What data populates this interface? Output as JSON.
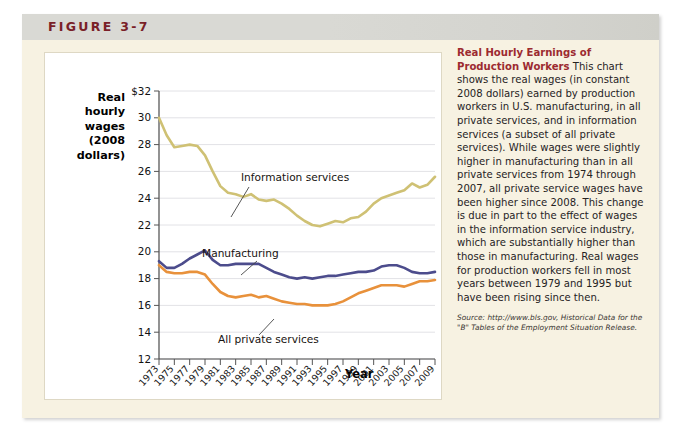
{
  "figure": {
    "label": "FIGURE 3-7"
  },
  "caption": {
    "title": "Real Hourly Earnings of Production Workers",
    "body": " This chart shows the real wages (in constant 2008 dollars) earned by production workers in U.S. manufacturing, in all private services, and in information services (a subset of all private services). While wages were slightly higher in manufacturing than in all private services from 1974 through 2007, all private service wages have been higher since 2008. This change is due in part to the effect of wages in the information service industry, which are substantially higher than those in manufacturing. Real wages for production workers fell in most years between 1979 and 1995 but have been rising since then.",
    "source": "Source: http://www.bls.gov, Historical Data for the \"B\" Tables of the Employment Situation Release."
  },
  "chart_data": {
    "type": "line",
    "title": "Real Hourly Earnings of Production Workers",
    "ylabel": "Real hourly wages (2008 dollars)",
    "ylabel_lines": [
      "Real",
      "hourly",
      "wages",
      "(2008",
      "dollars)"
    ],
    "xlabel": "Year",
    "ylim": [
      12,
      32
    ],
    "ytick_labels": [
      "$32",
      "30",
      "28",
      "26",
      "24",
      "22",
      "20",
      "18",
      "16",
      "14",
      "12"
    ],
    "ytick_values": [
      32,
      30,
      28,
      26,
      24,
      22,
      20,
      18,
      16,
      14,
      12
    ],
    "grid": true,
    "legend_position": "inline-annotations",
    "x": [
      1973,
      1974,
      1975,
      1976,
      1977,
      1978,
      1979,
      1980,
      1981,
      1982,
      1983,
      1984,
      1985,
      1986,
      1987,
      1988,
      1989,
      1990,
      1991,
      1992,
      1993,
      1994,
      1995,
      1996,
      1997,
      1998,
      1999,
      2000,
      2001,
      2002,
      2003,
      2004,
      2005,
      2006,
      2007,
      2008,
      2009
    ],
    "xtick_labels": [
      "1973",
      "1975",
      "1977",
      "1979",
      "1981",
      "1983",
      "1985",
      "1987",
      "1989",
      "1991",
      "1993",
      "1995",
      "1997",
      "1999",
      "2001",
      "2003",
      "2005",
      "2007",
      "2009"
    ],
    "series": [
      {
        "name": "Information services",
        "color": "#cfc174",
        "values": [
          30.0,
          28.7,
          27.8,
          27.9,
          28.0,
          27.9,
          27.2,
          26.0,
          24.9,
          24.4,
          24.3,
          24.1,
          24.3,
          23.9,
          23.8,
          23.9,
          23.6,
          23.2,
          22.7,
          22.3,
          22.0,
          21.9,
          22.1,
          22.3,
          22.2,
          22.5,
          22.6,
          23.0,
          23.6,
          24.0,
          24.2,
          24.4,
          24.6,
          25.1,
          24.8,
          25.0,
          25.6
        ]
      },
      {
        "name": "Manufacturing",
        "color": "#4c4c8c",
        "values": [
          19.3,
          18.8,
          18.8,
          19.1,
          19.5,
          19.8,
          20.1,
          19.4,
          19.0,
          19.0,
          19.1,
          19.1,
          19.1,
          19.1,
          18.8,
          18.5,
          18.3,
          18.1,
          18.0,
          18.1,
          18.0,
          18.1,
          18.2,
          18.2,
          18.3,
          18.4,
          18.5,
          18.5,
          18.6,
          18.9,
          19.0,
          19.0,
          18.8,
          18.5,
          18.4,
          18.4,
          18.5
        ]
      },
      {
        "name": "All private services",
        "color": "#e8913b",
        "values": [
          19.0,
          18.5,
          18.4,
          18.4,
          18.5,
          18.5,
          18.3,
          17.6,
          17.0,
          16.7,
          16.6,
          16.7,
          16.8,
          16.6,
          16.7,
          16.5,
          16.3,
          16.2,
          16.1,
          16.1,
          16.0,
          16.0,
          16.0,
          16.1,
          16.3,
          16.6,
          16.9,
          17.1,
          17.3,
          17.5,
          17.5,
          17.5,
          17.4,
          17.6,
          17.8,
          17.8,
          17.9
        ]
      }
    ],
    "annotations": [
      {
        "text": "Information services",
        "series": "Information services"
      },
      {
        "text": "Manufacturing",
        "series": "Manufacturing"
      },
      {
        "text": "All private services",
        "series": "All private services"
      }
    ]
  }
}
